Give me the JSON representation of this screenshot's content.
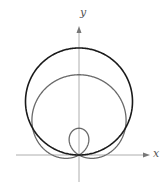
{
  "figure": {
    "type": "polar-graph",
    "axes": {
      "x_label": "x",
      "y_label": "y"
    },
    "origin_px": [
      79,
      155
    ],
    "unit_px": 26.75,
    "curves": [
      {
        "name": "circle",
        "equation": "r = 4 sin θ",
        "color": "#1a1a1a",
        "stroke_width": 1.6
      },
      {
        "name": "limacon",
        "equation": "r = 1 + 2 sin θ",
        "color": "#6a6a6a",
        "stroke_width": 1.3
      }
    ],
    "axis_color": "#9a9a9a"
  }
}
